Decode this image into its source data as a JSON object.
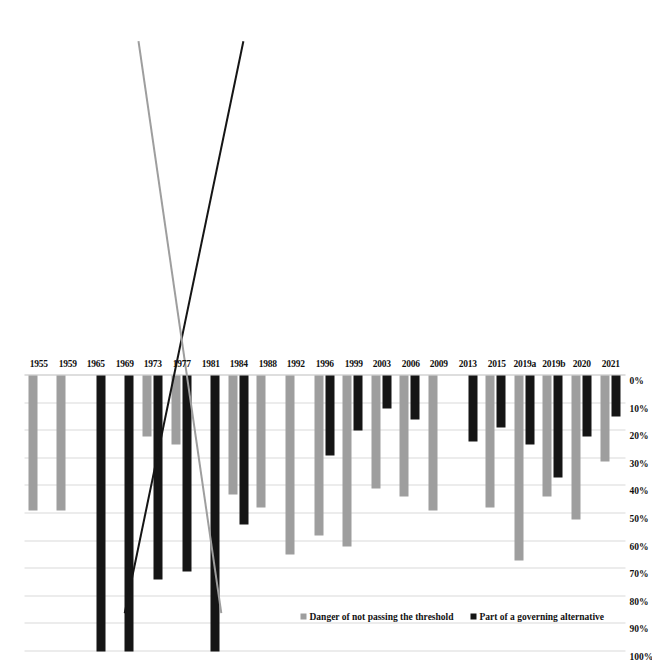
{
  "chart_data": {
    "type": "bar",
    "orientation": "horizontal",
    "title": "",
    "xlabel": "",
    "ylabel": "",
    "xlim": [
      0,
      100
    ],
    "xticks": [
      "0%",
      "10%",
      "20%",
      "30%",
      "40%",
      "50%",
      "60%",
      "70%",
      "80%",
      "90%",
      "100%"
    ],
    "xtick_values": [
      0,
      10,
      20,
      30,
      40,
      50,
      60,
      70,
      80,
      90,
      100
    ],
    "grid": true,
    "legend_position": "top-left",
    "categories": [
      "1955",
      "1959",
      "1965",
      "1969",
      "1973",
      "1977",
      "1981",
      "1984",
      "1988",
      "1992",
      "1996",
      "1999",
      "2003",
      "2006",
      "2009",
      "2013",
      "2015",
      "2019a",
      "2019b",
      "2020",
      "2021"
    ],
    "series": [
      {
        "name": "Part of a governing alternative",
        "color": "#151515",
        "values": [
          0,
          0,
          100,
          100,
          74,
          71,
          100,
          54,
          0,
          0,
          29,
          20,
          12,
          16,
          0,
          24,
          19,
          25,
          37,
          22,
          15
        ]
      },
      {
        "name": "Danger of not passing the threshold",
        "color": "#9e9e9e",
        "values": [
          49,
          49,
          0,
          0,
          22,
          25,
          0,
          43,
          48,
          65,
          58,
          62,
          41,
          44,
          49,
          0,
          48,
          67,
          44,
          52,
          31
        ]
      }
    ],
    "trendlines": [
      {
        "name": "governing-alternative-trend",
        "color": "#151515",
        "from": {
          "category": "1955",
          "value": 55
        },
        "to": {
          "category": "2021",
          "value": 12
        }
      },
      {
        "name": "threshold-danger-trend",
        "color": "#9e9e9e",
        "from": {
          "category": "1955",
          "value": 20
        },
        "to": {
          "category": "2021",
          "value": 50
        }
      }
    ]
  },
  "legend": {
    "entries": [
      {
        "label": "Part of a governing alternative",
        "marker": "black-square"
      },
      {
        "label": "Danger of not passing the threshold",
        "marker": "gray-square"
      }
    ]
  }
}
